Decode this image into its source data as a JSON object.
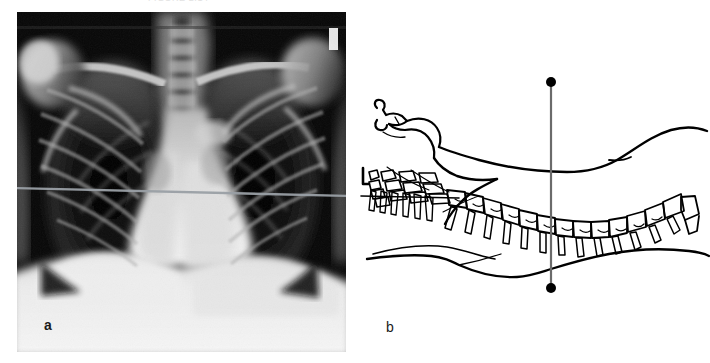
{
  "figure": {
    "cut_header_text": "FIGURE 2.14",
    "background_color": "#ffffff"
  },
  "panels": [
    {
      "id": "a",
      "label": "a",
      "label_color": "#1a1a1a",
      "type": "chest-radiograph",
      "modality": "X-ray",
      "view": "PA chest",
      "background_color": "#0a0a0a",
      "reference_line": {
        "name": "horizontal-reference-line",
        "orientation": "horizontal",
        "color": "#9aa0a6",
        "y_fraction": 0.525
      },
      "anatomy": [
        "clavicles",
        "ribs",
        "lung fields",
        "mediastinum",
        "cardiac silhouette",
        "diaphragm",
        "shoulder girdle",
        "thoracic spine"
      ]
    },
    {
      "id": "b",
      "label": "b",
      "label_color": "#1a1a1a",
      "type": "line-drawing",
      "view": "lateral supine patient",
      "background_color": "#ffffff",
      "reference_line": {
        "name": "vertical-reference-line",
        "orientation": "vertical",
        "color": "#6b6b6b",
        "x": 196,
        "y_top": 82,
        "y_bottom": 288,
        "endpoint_marker": "filled-dot",
        "endpoint_color": "#000000",
        "endpoint_radius": 5
      },
      "anatomy": [
        "head in profile",
        "face",
        "neck",
        "cervical vertebrae",
        "thoracic vertebrae",
        "lumbar vertebrae",
        "spinous processes",
        "torso outline",
        "back contour"
      ]
    }
  ],
  "colors": {
    "ink": "#000000",
    "paper": "#ffffff",
    "reference_gray": "#6b6b6b",
    "xray_black": "#0a0a0a"
  }
}
